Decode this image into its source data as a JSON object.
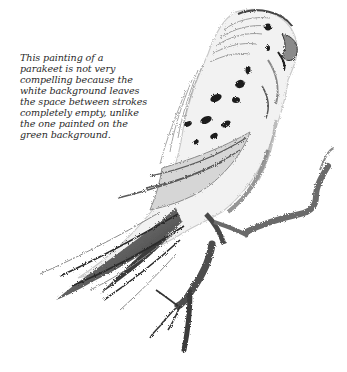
{
  "caption": {
    "lines": [
      "This painting of a",
      "parakeet is not very",
      "compelling because the",
      "white background leaves",
      "the space between strokes",
      "completely empty, unlike",
      "the one painted on the",
      "green background."
    ]
  },
  "illustration": {
    "subject": "parakeet perched on a branch",
    "style": "grayscale pastel sketch on white background",
    "colors": {
      "background": "#ffffff",
      "stroke_dark": "#1e1e1e",
      "stroke_mid": "#6e6e6e",
      "stroke_light": "#b9b9b9"
    }
  }
}
